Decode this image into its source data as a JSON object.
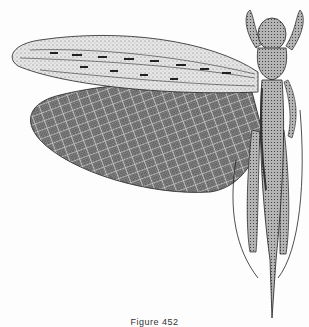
{
  "figure": {
    "caption": "Figure 452",
    "style": "stippled pen-and-ink",
    "colors": {
      "background": "#fdfdfd",
      "ink": "#1a1a1a",
      "forewing_fill": "#d9d9d9",
      "hindwing_fill": "#6e6e6e",
      "body_fill": "#9a9a9a"
    }
  }
}
